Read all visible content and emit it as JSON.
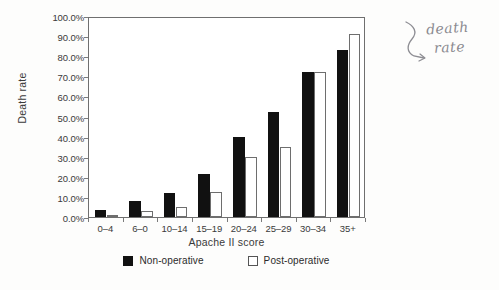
{
  "chart_data": {
    "type": "bar",
    "title": "",
    "xlabel": "Apache II score",
    "ylabel": "Death rate",
    "categories": [
      "0–4",
      "6–0",
      "10–14",
      "15–19",
      "20–24",
      "25–29",
      "30–34",
      "35+"
    ],
    "series": [
      {
        "name": "Non-operative",
        "color": "#111111",
        "values": [
          3.5,
          8.0,
          12.0,
          21.5,
          40.0,
          52.0,
          72.0,
          83.0
        ]
      },
      {
        "name": "Post-operative",
        "color": "#ffffff",
        "values": [
          1.2,
          3.0,
          5.0,
          12.5,
          30.0,
          35.0,
          72.0,
          91.0
        ]
      }
    ],
    "ylim": [
      0,
      100
    ],
    "ytick_values": [
      0,
      10,
      20,
      30,
      40,
      50,
      60,
      70,
      80,
      90,
      100
    ],
    "ytick_labels": [
      "0.0%",
      "10.0%",
      "20.0%",
      "30.0%",
      "40.0%",
      "50.0%",
      "60.0%",
      "70.0%",
      "80.0%",
      "90.0%",
      "100.0%"
    ],
    "grid": false,
    "legend_position": "bottom"
  },
  "annotation": {
    "handwritten_line1": "death",
    "handwritten_line2": "rate",
    "arrow_glyph": "↳"
  },
  "caption": {
    "sliver_text": ""
  }
}
